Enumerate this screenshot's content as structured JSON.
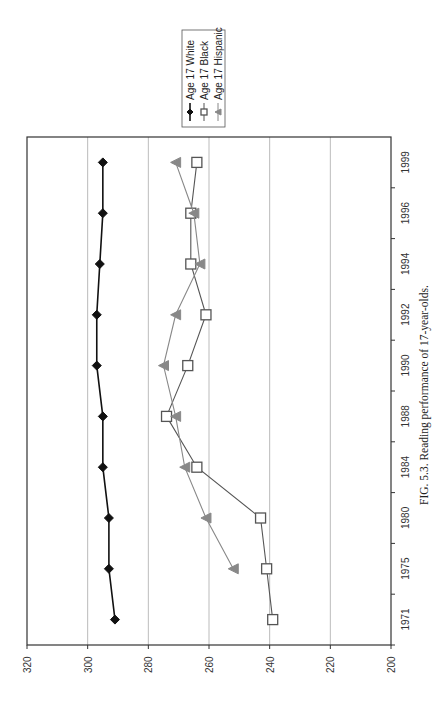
{
  "chart_data": {
    "type": "line",
    "title": "",
    "caption": "FIG. 5.3.  Reading performance of 17-year-olds.",
    "orientation": "rotated-90-ccw",
    "xlabel": "",
    "ylabel": "",
    "categories": [
      "1971",
      "1975",
      "1980",
      "1984",
      "1988",
      "1990",
      "1992",
      "1994",
      "1996",
      "1999"
    ],
    "ylim": [
      200,
      320
    ],
    "yticks": [
      200,
      220,
      240,
      260,
      280,
      300,
      320
    ],
    "grid": true,
    "legend_position": "top-right (rotated)",
    "series": [
      {
        "name": "Age 17 White",
        "marker": "diamond",
        "color": "#111111",
        "values": [
          291,
          293,
          293,
          295,
          295,
          297,
          297,
          296,
          295,
          295
        ]
      },
      {
        "name": "Age 17 Black",
        "marker": "square-open",
        "color": "#555555",
        "values": [
          239,
          241,
          243,
          264,
          274,
          267,
          261,
          266,
          266,
          264
        ]
      },
      {
        "name": "Age 17 Hispanic",
        "marker": "triangle",
        "color": "#888888",
        "values": [
          null,
          252,
          261,
          268,
          271,
          275,
          271,
          263,
          265,
          271
        ]
      }
    ]
  },
  "legend": {
    "items": [
      "Age 17 White",
      "Age 17 Black",
      "Age 17 Hispanic"
    ]
  },
  "axis": {
    "y_tick_labels": [
      "320",
      "300",
      "280",
      "260",
      "240",
      "220",
      "200"
    ],
    "x_tick_labels": [
      "1971",
      "1975",
      "1980",
      "1984",
      "1988",
      "1990",
      "1992",
      "1994",
      "1996",
      "1999"
    ]
  },
  "caption": "FIG. 5.3.  Reading performance of 17-year-olds."
}
